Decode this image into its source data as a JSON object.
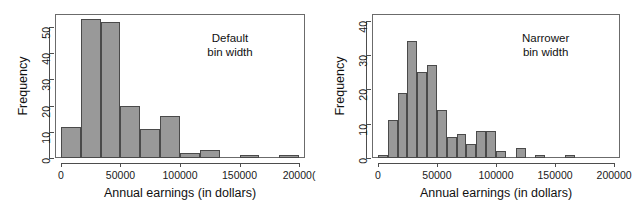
{
  "figure": {
    "background": "#ffffff",
    "bar_fill": "#999999",
    "bar_stroke": "#4a4a4a",
    "axis_color": "#4d4d4d",
    "frame_color": "#6b6b6b"
  },
  "chart_data": [
    {
      "type": "bar",
      "id": "default-bin-width",
      "title": "",
      "annotation_line1": "Default",
      "annotation_line2": "bin width",
      "xlabel": "Annual earnings (in dollars)",
      "ylabel": "Frequency",
      "xlim": [
        -5000,
        205000
      ],
      "ylim": [
        0,
        55
      ],
      "grid": false,
      "legend": "none",
      "xticks": [
        0,
        50000,
        100000,
        150000,
        200000
      ],
      "xtick_labels": [
        "0",
        "50000",
        "100000",
        "150000",
        "20000("
      ],
      "yticks": [
        0,
        10,
        20,
        30,
        40,
        50
      ],
      "ytick_labels": [
        "0",
        "10",
        "20",
        "30",
        "40",
        "50"
      ],
      "bin_width": 16667,
      "bin_edges": [
        0,
        16667,
        33333,
        50000,
        66667,
        83333,
        100000,
        116667,
        133333,
        150000,
        166667,
        183333,
        200000
      ],
      "values": [
        12,
        53,
        52,
        20,
        11,
        16,
        2,
        3,
        0,
        1,
        0,
        1
      ]
    },
    {
      "type": "bar",
      "id": "narrower-bin-width",
      "title": "",
      "annotation_line1": "Narrower",
      "annotation_line2": "bin width",
      "xlabel": "Annual earnings (in dollars)",
      "ylabel": "Frequency",
      "xlim": [
        -5000,
        205000
      ],
      "ylim": [
        0,
        42
      ],
      "grid": false,
      "legend": "none",
      "xticks": [
        0,
        50000,
        100000,
        150000,
        200000
      ],
      "xtick_labels": [
        "0",
        "50000",
        "100000",
        "150000",
        "200000"
      ],
      "yticks": [
        0,
        10,
        20,
        30,
        40
      ],
      "ytick_labels": [
        "0",
        "10",
        "20",
        "30",
        "40"
      ],
      "bin_width": 8333,
      "bin_edges": [
        0,
        8333,
        16667,
        25000,
        33333,
        41667,
        50000,
        58333,
        66667,
        75000,
        83333,
        91667,
        100000,
        108333,
        116667,
        125000,
        133333,
        141667,
        150000,
        158333,
        166667,
        175000
      ],
      "values": [
        1,
        11,
        19,
        34,
        25,
        27,
        14,
        6,
        7,
        4,
        8,
        8,
        2,
        0,
        3,
        0,
        1,
        0,
        0,
        1,
        0
      ]
    }
  ]
}
